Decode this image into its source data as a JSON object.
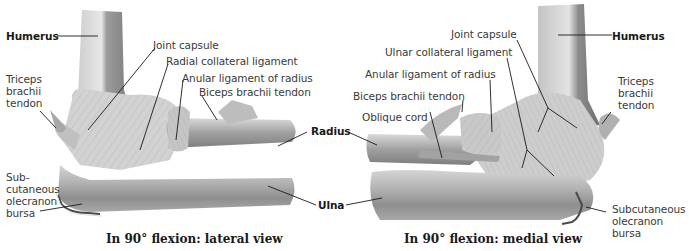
{
  "figure": {
    "views": [
      {
        "id": "lateral",
        "caption": "In 90° flexion: lateral view",
        "labels": {
          "humerus": "Humerus",
          "joint_capsule": "Joint capsule",
          "radial_collateral_ligament": "Radial collateral ligament",
          "anular_ligament": "Anular ligament of radius",
          "biceps_tendon": "Biceps brachii tendon",
          "triceps_tendon": "Triceps\nbrachii\ntendon",
          "olecranon_bursa": "Sub-\ncutaneous\nolecranon\nbursa"
        }
      },
      {
        "id": "medial",
        "caption": "In 90° flexion: medial view",
        "labels": {
          "humerus": "Humerus",
          "joint_capsule": "Joint capsule",
          "ulnar_collateral_ligament": "Ulnar collateral ligament",
          "anular_ligament": "Anular ligament of radius",
          "biceps_tendon": "Biceps brachii tendon",
          "oblique_cord": "Oblique cord",
          "triceps_tendon": "Triceps\nbrachii\ntendon",
          "olecranon_bursa": "Subcutaneous\nolecranon\nbursa"
        }
      }
    ],
    "shared_labels": {
      "radius": "Radius",
      "ulna": "Ulna"
    },
    "colors": {
      "bone_light": "#d9d9d9",
      "bone_mid": "#b5b5b5",
      "bone_dark": "#8a8a8a",
      "ligament": "#c8c8c8",
      "leader_line": "#1a1a1a",
      "text": "#3a3a3a"
    }
  }
}
